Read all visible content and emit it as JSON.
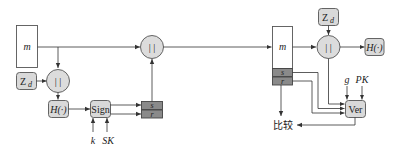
{
  "diagram": {
    "title": "",
    "signing_side": {
      "message_box": {
        "label": "m"
      },
      "random_box": {
        "label": "Z",
        "subscript": "d"
      },
      "concat_inner": {
        "label": "| |"
      },
      "hash_box": {
        "label": "H(·)"
      },
      "sign_box": {
        "label": "Sign"
      },
      "sign_inputs": [
        {
          "label": "k"
        },
        {
          "label": "SK"
        }
      ],
      "signature_box": {
        "top": "s",
        "bottom": "r"
      },
      "concat_outer": {
        "label": "| |"
      }
    },
    "verifying_side": {
      "message_box": {
        "label": "m",
        "s": "s",
        "r": "r"
      },
      "random_box": {
        "label": "Z",
        "subscript": "d"
      },
      "concat": {
        "label": "| |"
      },
      "hash_box": {
        "label": "H(·)"
      },
      "verify_box": {
        "label": "Ver"
      },
      "verify_inputs": [
        {
          "label": "g"
        },
        {
          "label": "PK"
        }
      ],
      "compare": {
        "label": "比较"
      }
    },
    "colors": {
      "box_fill": "#d9d9d9",
      "signature_fill": "#8a8a8a",
      "stroke": "#555555",
      "line": "#333333"
    }
  }
}
